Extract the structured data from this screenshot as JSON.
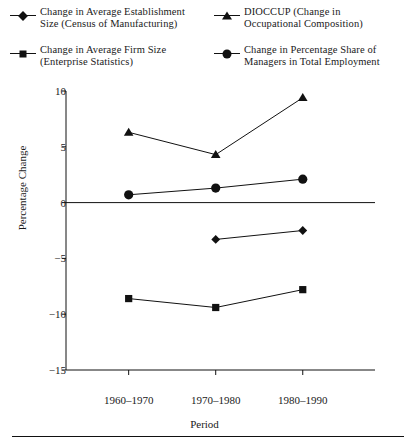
{
  "legend": {
    "items": [
      {
        "key": "estab",
        "marker": "diamond-marker-icon",
        "line1": "Change in Average Establishment",
        "line2": "Size (Census of Manufacturing)"
      },
      {
        "key": "firm",
        "marker": "square-marker-icon",
        "line1": "Change in  Average Firm  Size",
        "line2": "(Enterprise Statistics)"
      },
      {
        "key": "dioccup",
        "marker": "triangle-marker-icon",
        "line1": "DIOCCUP (Change in",
        "line2": "Occupational Composition)"
      },
      {
        "key": "mgr",
        "marker": "circle-marker-icon",
        "line1": "Change in Percentage Share of",
        "line2": "Managers in Total  Employment"
      }
    ]
  },
  "chart_data": {
    "type": "line",
    "title": "",
    "xlabel": "Period",
    "ylabel": "Percentage Change",
    "categories": [
      "1960–1970",
      "1970–1980",
      "1980–1990"
    ],
    "ylim": [
      -15,
      10
    ],
    "yticks": [
      10,
      5,
      0,
      -5,
      -10,
      -15
    ],
    "ytick_labels": [
      "10",
      "5",
      "0",
      "−5",
      "−10",
      "−15"
    ],
    "grid": false,
    "legend_position": "top",
    "zero_line": true,
    "series": [
      {
        "name": "Change in Average Establishment Size (Census of Manufacturing)",
        "marker": "diamond",
        "x": [
          "1970–1980",
          "1980–1990"
        ],
        "values": [
          -3.3,
          -2.5
        ]
      },
      {
        "name": "Change in Average Firm Size (Enterprise Statistics)",
        "marker": "square",
        "x": [
          "1960–1970",
          "1970–1980",
          "1980–1990"
        ],
        "values": [
          -8.6,
          -9.4,
          -7.8
        ]
      },
      {
        "name": "DIOCCUP (Change in Occupational Composition)",
        "marker": "triangle",
        "x": [
          "1960–1970",
          "1970–1980",
          "1980–1990"
        ],
        "values": [
          6.3,
          4.3,
          9.4
        ]
      },
      {
        "name": "Change in Percentage Share of Managers in Total Employment",
        "marker": "circle",
        "x": [
          "1960–1970",
          "1970–1980",
          "1980–1990"
        ],
        "values": [
          0.7,
          1.3,
          2.1
        ]
      }
    ]
  },
  "colors": {
    "ink": "#111111",
    "background": "#ffffff"
  }
}
